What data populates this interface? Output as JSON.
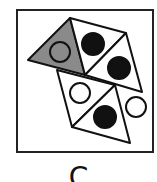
{
  "figure": {
    "option_label": "C",
    "frame": {
      "x": 17,
      "y": 10,
      "width": 136,
      "height": 142
    },
    "colors": {
      "stroke": "#111111",
      "shaded": "#8a8a8a",
      "filled_circle": "#111111",
      "empty_circle": "#ffffff",
      "background": "#ffffff"
    },
    "triangles": [
      {
        "id": "shaded-triangle",
        "points": "28,60 70,18 85,75",
        "fill": "shaded",
        "circle": {
          "cx": 60,
          "cy": 52,
          "r": 10,
          "type": "outline"
        }
      },
      {
        "id": "top-triangle-1",
        "points": "70,18 126,33 85,75",
        "fill": "white",
        "circle": {
          "cx": 93,
          "cy": 44,
          "r": 11,
          "type": "filled"
        }
      },
      {
        "id": "top-triangle-2",
        "points": "126,33 142,92 85,75",
        "fill": "white",
        "circle": {
          "cx": 119,
          "cy": 68,
          "r": 11,
          "type": "filled"
        }
      },
      {
        "id": "lower-triangle-1",
        "points": "57,70 115,85 72,127",
        "fill": "white",
        "circle": {
          "cx": 80,
          "cy": 93,
          "r": 10,
          "type": "outline"
        }
      },
      {
        "id": "lower-triangle-2",
        "points": "115,85 130,143 72,127",
        "fill": "white",
        "circle": {
          "cx": 105,
          "cy": 117,
          "r": 11,
          "type": "filled"
        }
      },
      {
        "id": "side-circle",
        "points": "",
        "fill": "none",
        "circle": {
          "cx": 136,
          "cy": 107,
          "r": 10,
          "type": "outline"
        }
      }
    ]
  }
}
